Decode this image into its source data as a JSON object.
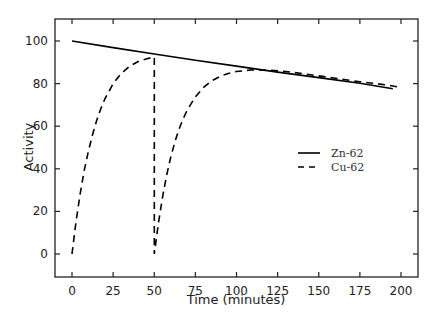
{
  "chart_data": {
    "type": "line",
    "title": "",
    "xlabel": "Time (minutes)",
    "ylabel": "Activity",
    "xlim": [
      -10,
      210
    ],
    "ylim": [
      -10,
      110
    ],
    "xticks": [
      0,
      25,
      50,
      75,
      100,
      125,
      150,
      175,
      200
    ],
    "yticks": [
      0,
      20,
      40,
      60,
      80,
      100
    ],
    "grid": false,
    "legend_position": "center-right",
    "series": [
      {
        "name": "Zn-62",
        "style": "solid",
        "color": "#000000",
        "x": [
          0,
          25,
          50,
          75,
          100,
          125,
          150,
          175,
          195
        ],
        "y": [
          100,
          96.9,
          93.9,
          91.0,
          88.2,
          85.4,
          82.8,
          80.2,
          77.6
        ]
      },
      {
        "name": "Cu-62",
        "style": "dashed",
        "color": "#000000",
        "x": [
          0,
          2.5,
          5,
          7.5,
          10,
          12.5,
          15,
          17.5,
          20,
          25,
          30,
          35,
          40,
          45,
          50,
          50,
          52.5,
          55,
          57.5,
          60,
          62.5,
          65,
          67.5,
          70,
          75,
          80,
          85,
          90,
          95,
          100,
          110,
          120,
          130,
          140,
          150,
          160,
          175,
          190,
          198
        ],
        "y": [
          0,
          15.5,
          28.3,
          39.4,
          48.5,
          56.1,
          62.7,
          68.2,
          72.8,
          79.9,
          84.8,
          88.1,
          90.3,
          91.6,
          92.5,
          0,
          14.4,
          26.6,
          36.9,
          45.4,
          52.5,
          58.5,
          63.4,
          67.5,
          73.8,
          78.2,
          81.3,
          83.4,
          84.8,
          85.7,
          86.5,
          86.3,
          85.7,
          84.7,
          83.6,
          82.5,
          80.9,
          79.5,
          78.5
        ]
      }
    ]
  },
  "axes": {
    "xlabel": "Time (minutes)",
    "ylabel": "Activity",
    "xtick_labels": [
      "0",
      "25",
      "50",
      "75",
      "100",
      "125",
      "150",
      "175",
      "200"
    ],
    "ytick_labels": [
      "0",
      "20",
      "40",
      "60",
      "80",
      "100"
    ]
  },
  "legend": {
    "items": [
      {
        "label": "Zn-62",
        "style": "solid"
      },
      {
        "label": "Cu-62",
        "style": "dashed"
      }
    ]
  }
}
